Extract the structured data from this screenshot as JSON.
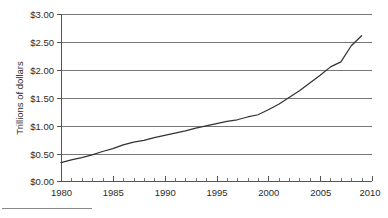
{
  "chart_data": {
    "type": "line",
    "title": "",
    "subtitle": "",
    "xlabel": "",
    "ylabel": "Trillions of dollars",
    "xlim": [
      1980,
      2010
    ],
    "ylim": [
      0.0,
      3.0
    ],
    "grid": true,
    "legend": null,
    "y_tick_labels": [
      "$0.00",
      "$0.50",
      "$1.00",
      "$1.50",
      "$2.00",
      "$2.50",
      "$3.00"
    ],
    "y_tick_values": [
      0.0,
      0.5,
      1.0,
      1.5,
      2.0,
      2.5,
      3.0
    ],
    "x_tick_labels": [
      "1980",
      "1985",
      "1990",
      "1995",
      "2000",
      "2005",
      "2010"
    ],
    "x_tick_values": [
      1980,
      1985,
      1990,
      1995,
      2000,
      2005,
      2010
    ],
    "x_minor_tick_step": 1,
    "series": [
      {
        "name": "",
        "color": "#333333",
        "x": [
          1980,
          1981,
          1982,
          1983,
          1984,
          1985,
          1986,
          1987,
          1988,
          1989,
          1990,
          1991,
          1992,
          1993,
          1994,
          1995,
          1996,
          1997,
          1998,
          1999,
          2000,
          2001,
          2002,
          2003,
          2004,
          2005,
          2006,
          2007,
          2008,
          2009
        ],
        "values": [
          0.33,
          0.38,
          0.42,
          0.47,
          0.53,
          0.58,
          0.65,
          0.7,
          0.73,
          0.78,
          0.82,
          0.86,
          0.9,
          0.95,
          0.99,
          1.03,
          1.07,
          1.1,
          1.15,
          1.19,
          1.28,
          1.38,
          1.5,
          1.62,
          1.76,
          1.9,
          2.05,
          2.14,
          2.43,
          2.61
        ]
      }
    ]
  },
  "figure": {
    "axis_label_y": "Trillions of dollars",
    "footer_rule_present": true
  },
  "colors": {
    "gridline": "#777777",
    "axis": "#555555",
    "data_line": "#333333",
    "text": "#2b2b2b",
    "background": "#ffffff"
  }
}
